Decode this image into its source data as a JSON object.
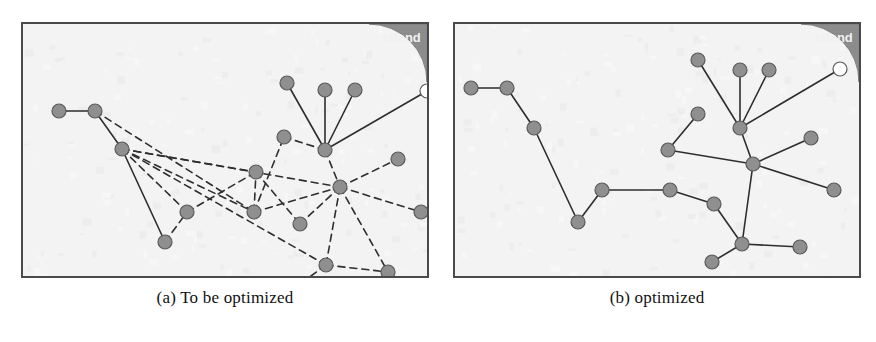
{
  "figure": {
    "panels": [
      {
        "id": "a",
        "caption": "(a) To be optimized",
        "island_label": "Island",
        "edge_style": "mixed-solid-dashed",
        "nodes": [
          {
            "id": "n1",
            "x": 36,
            "y": 87,
            "type": "filled"
          },
          {
            "id": "n2",
            "x": 72,
            "y": 87,
            "type": "filled"
          },
          {
            "id": "n3",
            "x": 99,
            "y": 125,
            "type": "filled"
          },
          {
            "id": "n4",
            "x": 142,
            "y": 218,
            "type": "filled"
          },
          {
            "id": "n5",
            "x": 164,
            "y": 188,
            "type": "filled"
          },
          {
            "id": "n6",
            "x": 231,
            "y": 188,
            "type": "filled"
          },
          {
            "id": "n7",
            "x": 233,
            "y": 148,
            "type": "filled"
          },
          {
            "id": "n8",
            "x": 261,
            "y": 113,
            "type": "filled"
          },
          {
            "id": "n9",
            "x": 264,
            "y": 59,
            "type": "filled"
          },
          {
            "id": "n10",
            "x": 302,
            "y": 66,
            "type": "filled"
          },
          {
            "id": "n11",
            "x": 332,
            "y": 66,
            "type": "filled"
          },
          {
            "id": "n12",
            "x": 302,
            "y": 126,
            "type": "filled"
          },
          {
            "id": "n13",
            "x": 317,
            "y": 163,
            "type": "filled"
          },
          {
            "id": "n14",
            "x": 375,
            "y": 135,
            "type": "filled"
          },
          {
            "id": "n15",
            "x": 398,
            "y": 188,
            "type": "filled"
          },
          {
            "id": "n16",
            "x": 277,
            "y": 200,
            "type": "filled"
          },
          {
            "id": "n17",
            "x": 303,
            "y": 241,
            "type": "filled"
          },
          {
            "id": "n18",
            "x": 277,
            "y": 260,
            "type": "filled"
          },
          {
            "id": "n19",
            "x": 365,
            "y": 248,
            "type": "filled"
          },
          {
            "id": "n20",
            "x": 404,
            "y": 67,
            "type": "hollow"
          }
        ],
        "edges": [
          {
            "from": "n1",
            "to": "n2",
            "style": "solid"
          },
          {
            "from": "n2",
            "to": "n3",
            "style": "solid"
          },
          {
            "from": "n3",
            "to": "n4",
            "style": "solid"
          },
          {
            "from": "n9",
            "to": "n12",
            "style": "solid"
          },
          {
            "from": "n10",
            "to": "n12",
            "style": "solid"
          },
          {
            "from": "n11",
            "to": "n12",
            "style": "solid"
          },
          {
            "from": "n20",
            "to": "n12",
            "style": "solid"
          },
          {
            "from": "n2",
            "to": "n6",
            "style": "dashed"
          },
          {
            "from": "n3",
            "to": "n6",
            "style": "dashed"
          },
          {
            "from": "n3",
            "to": "n13",
            "style": "dashed"
          },
          {
            "from": "n3",
            "to": "n7",
            "style": "dashed"
          },
          {
            "from": "n3",
            "to": "n5",
            "style": "dashed"
          },
          {
            "from": "n3",
            "to": "n17",
            "style": "dashed"
          },
          {
            "from": "n4",
            "to": "n5",
            "style": "dashed"
          },
          {
            "from": "n5",
            "to": "n7",
            "style": "dashed"
          },
          {
            "from": "n6",
            "to": "n7",
            "style": "dashed"
          },
          {
            "from": "n6",
            "to": "n8",
            "style": "dashed"
          },
          {
            "from": "n6",
            "to": "n13",
            "style": "dashed"
          },
          {
            "from": "n8",
            "to": "n12",
            "style": "dashed"
          },
          {
            "from": "n7",
            "to": "n16",
            "style": "dashed"
          },
          {
            "from": "n12",
            "to": "n13",
            "style": "dashed"
          },
          {
            "from": "n13",
            "to": "n14",
            "style": "dashed"
          },
          {
            "from": "n13",
            "to": "n15",
            "style": "dashed"
          },
          {
            "from": "n13",
            "to": "n16",
            "style": "dashed"
          },
          {
            "from": "n13",
            "to": "n17",
            "style": "dashed"
          },
          {
            "from": "n13",
            "to": "n19",
            "style": "dashed"
          },
          {
            "from": "n17",
            "to": "n18",
            "style": "dashed"
          },
          {
            "from": "n17",
            "to": "n19",
            "style": "dashed"
          }
        ]
      },
      {
        "id": "b",
        "caption": "(b) optimized",
        "island_label": "Island",
        "edge_style": "solid",
        "nodes": [
          {
            "id": "m1",
            "x": 16,
            "y": 64,
            "type": "filled"
          },
          {
            "id": "m2",
            "x": 52,
            "y": 64,
            "type": "filled"
          },
          {
            "id": "m3",
            "x": 79,
            "y": 104,
            "type": "filled"
          },
          {
            "id": "m4",
            "x": 123,
            "y": 198,
            "type": "filled"
          },
          {
            "id": "m5",
            "x": 147,
            "y": 166,
            "type": "filled"
          },
          {
            "id": "m6",
            "x": 215,
            "y": 166,
            "type": "filled"
          },
          {
            "id": "m7",
            "x": 259,
            "y": 180,
            "type": "filled"
          },
          {
            "id": "m8",
            "x": 213,
            "y": 126,
            "type": "filled"
          },
          {
            "id": "m9",
            "x": 243,
            "y": 90,
            "type": "filled"
          },
          {
            "id": "m10",
            "x": 243,
            "y": 36,
            "type": "filled"
          },
          {
            "id": "m11",
            "x": 285,
            "y": 46,
            "type": "filled"
          },
          {
            "id": "m12",
            "x": 314,
            "y": 46,
            "type": "filled"
          },
          {
            "id": "m13",
            "x": 285,
            "y": 104,
            "type": "filled"
          },
          {
            "id": "m14",
            "x": 298,
            "y": 140,
            "type": "filled"
          },
          {
            "id": "m15",
            "x": 356,
            "y": 114,
            "type": "filled"
          },
          {
            "id": "m16",
            "x": 379,
            "y": 166,
            "type": "filled"
          },
          {
            "id": "m17",
            "x": 287,
            "y": 220,
            "type": "filled"
          },
          {
            "id": "m18",
            "x": 257,
            "y": 238,
            "type": "filled"
          },
          {
            "id": "m19",
            "x": 345,
            "y": 223,
            "type": "filled"
          },
          {
            "id": "m20",
            "x": 385,
            "y": 45,
            "type": "hollow"
          }
        ],
        "edges": [
          {
            "from": "m1",
            "to": "m2",
            "style": "solid"
          },
          {
            "from": "m2",
            "to": "m3",
            "style": "solid"
          },
          {
            "from": "m3",
            "to": "m4",
            "style": "solid"
          },
          {
            "from": "m4",
            "to": "m5",
            "style": "solid"
          },
          {
            "from": "m5",
            "to": "m6",
            "style": "solid"
          },
          {
            "from": "m6",
            "to": "m7",
            "style": "solid"
          },
          {
            "from": "m7",
            "to": "m17",
            "style": "solid"
          },
          {
            "from": "m8",
            "to": "m9",
            "style": "solid"
          },
          {
            "from": "m8",
            "to": "m14",
            "style": "solid"
          },
          {
            "from": "m10",
            "to": "m13",
            "style": "solid"
          },
          {
            "from": "m11",
            "to": "m13",
            "style": "solid"
          },
          {
            "from": "m12",
            "to": "m13",
            "style": "solid"
          },
          {
            "from": "m20",
            "to": "m13",
            "style": "solid"
          },
          {
            "from": "m13",
            "to": "m14",
            "style": "solid"
          },
          {
            "from": "m14",
            "to": "m15",
            "style": "solid"
          },
          {
            "from": "m14",
            "to": "m16",
            "style": "solid"
          },
          {
            "from": "m14",
            "to": "m17",
            "style": "solid"
          },
          {
            "from": "m17",
            "to": "m18",
            "style": "solid"
          },
          {
            "from": "m17",
            "to": "m19",
            "style": "solid"
          }
        ]
      }
    ],
    "style": {
      "panel_background": "#f3f3f3",
      "panel_border": "#4a4a4a",
      "island_fill": "#8c8c8c",
      "island_radius": 58,
      "island_label_color": "#f0f0f0",
      "node_fill": "#8f8f8f",
      "node_stroke": "#5a5a5a",
      "node_hollow_fill": "#ffffff",
      "node_radius": 7,
      "edge_color": "#2e2e2e",
      "page_background": "#ffffff"
    }
  }
}
